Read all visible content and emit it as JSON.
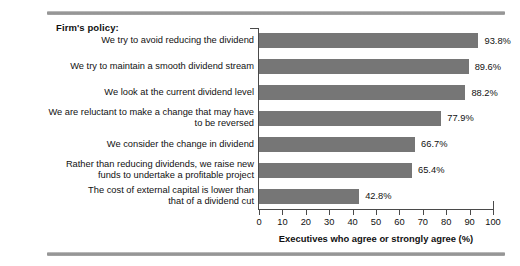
{
  "section": {
    "title": "Firm's policy:"
  },
  "chart_data": {
    "type": "bar",
    "orientation": "horizontal",
    "title": "",
    "xlabel": "Executives who agree or strongly agree (%)",
    "ylabel": "",
    "xlim": [
      0,
      100
    ],
    "xticks": [
      0,
      10,
      20,
      30,
      40,
      50,
      60,
      70,
      80,
      90,
      100
    ],
    "xtick_labels": [
      "0",
      "10",
      "20",
      "30",
      "40",
      "50",
      "60",
      "70",
      "80",
      "90",
      "100"
    ],
    "grid": false,
    "legend": false,
    "bar_color": "#767676",
    "categories": [
      "We try to avoid reducing the dividend",
      "We try to maintain a smooth dividend stream",
      "We look at the current dividend level",
      "We are reluctant to make a change that may have\nto be reversed",
      "We consider the change in dividend",
      "Rather than reducing dividends, we raise new\nfunds to undertake a profitable project",
      "The cost of external capital is lower than\nthat of a dividend cut"
    ],
    "values": [
      93.8,
      89.6,
      88.2,
      77.9,
      66.7,
      65.4,
      42.8
    ],
    "value_labels": [
      "93.8%",
      "89.6%",
      "88.2%",
      "77.9%",
      "66.7%",
      "65.4%",
      "42.8%"
    ]
  }
}
